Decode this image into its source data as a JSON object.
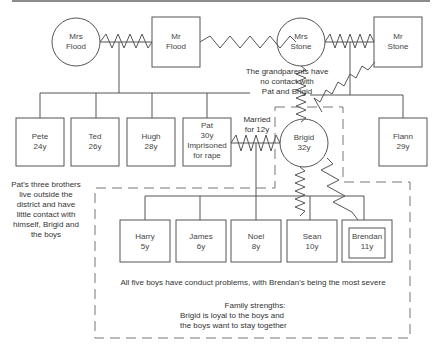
{
  "diagram": {
    "type": "genogram",
    "grandparents": {
      "mrs_flood": {
        "line1": "Mrs",
        "line2": "Flood",
        "shape": "circle"
      },
      "mr_flood": {
        "line1": "Mr",
        "line2": "Flood",
        "shape": "square"
      },
      "mrs_stone": {
        "line1": "Mrs",
        "line2": "Stone",
        "shape": "circle"
      },
      "mr_stone": {
        "line1": "Mr",
        "line2": "Stone",
        "shape": "square"
      }
    },
    "flood_children": [
      {
        "name": "Pete",
        "age": "24y"
      },
      {
        "name": "Ted",
        "age": "26y"
      },
      {
        "name": "Hugh",
        "age": "28y"
      },
      {
        "name": "Pat",
        "age": "30y",
        "note1": "Imprisoned",
        "note2": "for  rape"
      }
    ],
    "stone_children": [
      {
        "name": "Brigid",
        "age": "32y",
        "shape": "circle"
      },
      {
        "name": "Flann",
        "age": "29y",
        "shape": "square"
      }
    ],
    "grandchildren": [
      {
        "name": "Harry",
        "age": "5y"
      },
      {
        "name": "James",
        "age": "6y"
      },
      {
        "name": "Noel",
        "age": "8y"
      },
      {
        "name": "Sean",
        "age": "10y"
      },
      {
        "name": "Brendan",
        "age": "11y",
        "index_person": true
      }
    ],
    "annotations": {
      "grandparents_note": [
        "The grandparents have",
        "no contact with",
        "Pat and Brigid"
      ],
      "marriage_note": [
        "Married",
        "for 12y"
      ],
      "brothers_note": [
        "Pat's three brothers",
        "live outside the",
        "district and have",
        "little contact with",
        "himself, Brigid and",
        "the boys"
      ],
      "conduct_note": "All five boys have conduct problems, with Brendan's being the most severe",
      "strengths_title": "Family strengths:",
      "strengths_line1": "Brigid is loyal to the boys and",
      "strengths_line2": "the boys want to stay together"
    },
    "colors": {
      "line": "#555555",
      "text": "#444444",
      "background": "#ffffff"
    }
  }
}
